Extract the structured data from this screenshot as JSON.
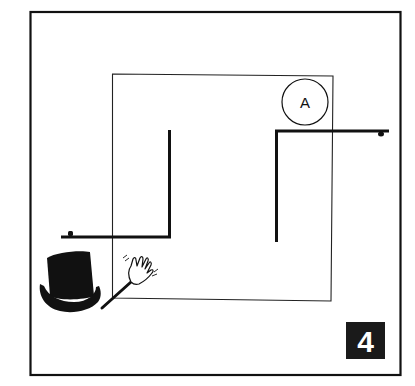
{
  "panel": {
    "number": "4",
    "circle_label": "A",
    "colors": {
      "background": "#ffffff",
      "ink": "#111111",
      "badge_bg": "#1a1a1a",
      "badge_text": "#ffffff"
    }
  },
  "elements": {
    "outer_frame": "panel-border",
    "inner_square": "room-outline",
    "left_wall": "L-shaped thick line bottom-left",
    "right_wall": "L-shaped thick line top-right",
    "circle": "circle-marker",
    "hat": "top-hat-icon",
    "hand": "waving-hand-icon"
  }
}
